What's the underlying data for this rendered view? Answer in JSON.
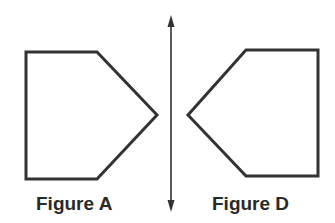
{
  "figures": [
    {
      "id": "A",
      "label": "Figure A",
      "points": "26,52 97,52 157,115 97,179 26,179"
    },
    {
      "id": "D",
      "label": "Figure D",
      "points": "246,50 318,50 318,176 246,176 188,115"
    }
  ],
  "line_of_reflection": {
    "x": 171,
    "y1": 15,
    "y2": 212
  },
  "colors": {
    "stroke": "#333333",
    "text": "#2a2a2a"
  }
}
